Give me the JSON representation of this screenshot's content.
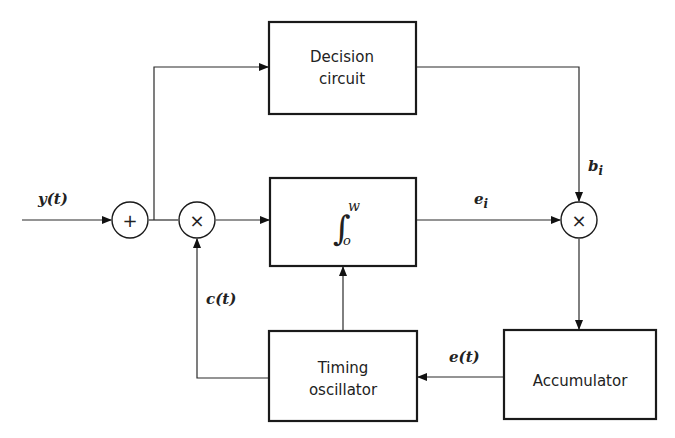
{
  "blocks": {
    "decision": {
      "line1": "Decision",
      "line2": "circuit"
    },
    "integrator": {
      "upper": "w",
      "lower": "o"
    },
    "oscillator": {
      "line1": "Timing",
      "line2": "oscillator"
    },
    "accumulator": {
      "label": "Accumulator"
    }
  },
  "nodes": {
    "adder": {
      "symbol": "+"
    },
    "mult1": {
      "symbol": "×"
    },
    "mult2": {
      "symbol": "×"
    }
  },
  "signals": {
    "input": {
      "name": "y",
      "sub": "(t)"
    },
    "ei": {
      "name": "e",
      "sub": "i"
    },
    "bi": {
      "name": "b",
      "sub": "i"
    },
    "ct": {
      "name": "c",
      "sub": "(t)"
    },
    "et": {
      "name": "e",
      "sub": "(t)"
    }
  }
}
